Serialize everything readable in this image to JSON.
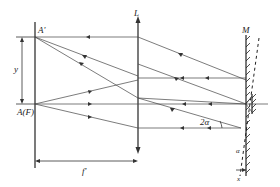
{
  "diagram": {
    "labels": {
      "image_point": "A'",
      "focal_point": "A(F)",
      "displacement": "y",
      "focal_length": "f'",
      "lens": "L",
      "mirror": "M",
      "double_angle": "2α",
      "angle": "α",
      "mirror_shift": "x"
    },
    "elements": [
      {
        "id": "focal-plane",
        "type": "line",
        "description": "focal plane (vertical line at left)"
      },
      {
        "id": "lens",
        "type": "lens",
        "label": "L"
      },
      {
        "id": "mirror",
        "type": "plane-mirror",
        "label": "M"
      },
      {
        "id": "tilted-mirror",
        "type": "dashed-line",
        "description": "mirror rotated by α"
      },
      {
        "id": "pivot-mirror",
        "type": "small-mirror",
        "description": "reference mirror at right"
      }
    ],
    "colors": {
      "stroke": "#333333",
      "background": "#ffffff"
    }
  }
}
